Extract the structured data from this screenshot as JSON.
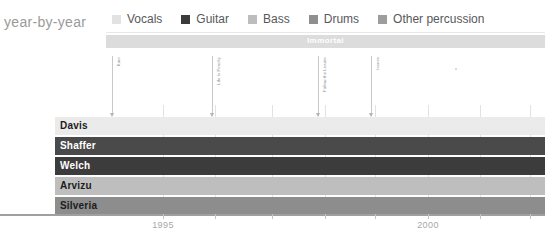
{
  "chart": {
    "title": "year-by-year",
    "album_band": {
      "label": "Immortal",
      "color": "#dcdcdc",
      "start_x": 106,
      "end_x": 545
    }
  },
  "legend": {
    "items": [
      {
        "label": "Vocals",
        "color": "#e2e2e2"
      },
      {
        "label": "Guitar",
        "color": "#3b3b3b"
      },
      {
        "label": "Bass",
        "color": "#bdbdbd"
      },
      {
        "label": "Drums",
        "color": "#8f8f8f"
      },
      {
        "label": "Other percussion",
        "color": "#9d9d9d"
      }
    ]
  },
  "markers": [
    {
      "label": "Korn",
      "x": 112
    },
    {
      "label": "Life Is Peachy",
      "x": 212
    },
    {
      "label": "Follow the Leader",
      "x": 318
    },
    {
      "label": "Issues",
      "x": 371
    }
  ],
  "gridlines": [
    163,
    215,
    272,
    325,
    375,
    428,
    480,
    530
  ],
  "axis": {
    "ticks": [
      {
        "label": "1995",
        "x": 163
      },
      {
        "label": "2000",
        "x": 428
      }
    ],
    "minor_ticks": [
      215,
      272,
      325,
      375,
      480,
      530
    ]
  },
  "rows": [
    {
      "name": "Davis",
      "role": "Vocals",
      "color": "#ebebeb",
      "text_color": "#1c1c1c"
    },
    {
      "name": "Shaffer",
      "role": "Guitar",
      "color": "#4a4a4a",
      "text_color": "#ffffff"
    },
    {
      "name": "Welch",
      "role": "Guitar",
      "color": "#3c3c3c",
      "text_color": "#ffffff"
    },
    {
      "name": "Arvizu",
      "role": "Bass",
      "color": "#bebebe",
      "text_color": "#1c1c1c"
    },
    {
      "name": "Silveria",
      "role": "Drums",
      "color": "#8d8d8d",
      "text_color": "#1c1c1c"
    }
  ],
  "chart_data": {
    "type": "bar",
    "title": "year-by-year",
    "xlabel": "",
    "ylabel": "",
    "xlim": [
      1993.5,
      2001.5
    ],
    "grid": true,
    "legend_position": "top",
    "categories": [
      "Davis",
      "Shaffer",
      "Welch",
      "Arvizu",
      "Silveria"
    ],
    "series": [
      {
        "name": "Vocals",
        "values": [
          1,
          0,
          0,
          0,
          0
        ],
        "color": "#ebebeb"
      },
      {
        "name": "Guitar",
        "values": [
          0,
          1,
          1,
          0,
          0
        ],
        "color": "#3c3c3c"
      },
      {
        "name": "Bass",
        "values": [
          0,
          0,
          0,
          1,
          0
        ],
        "color": "#bebebe"
      },
      {
        "name": "Drums",
        "values": [
          0,
          0,
          0,
          0,
          1
        ],
        "color": "#8d8d8d"
      },
      {
        "name": "Other percussion",
        "values": [
          0,
          0,
          0,
          0,
          0
        ],
        "color": "#9d9d9d"
      }
    ],
    "annotations": [
      "Korn",
      "Life Is Peachy",
      "Follow the Leader",
      "Issues",
      "Immortal"
    ],
    "tick_labels": [
      "1995",
      "2000"
    ]
  }
}
